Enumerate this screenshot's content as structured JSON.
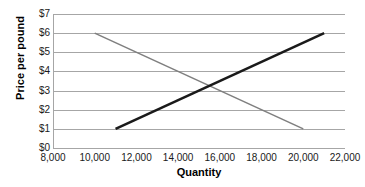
{
  "chart_data": {
    "type": "line",
    "title": "",
    "xlabel": "Quantity",
    "ylabel": "Price per pound",
    "xlim": [
      8000,
      22000
    ],
    "ylim": [
      0,
      7
    ],
    "xticks": [
      "8,000",
      "10,000",
      "12,000",
      "14,000",
      "16,000",
      "18,000",
      "20,000",
      "22,000"
    ],
    "xtick_values": [
      8000,
      10000,
      12000,
      14000,
      16000,
      18000,
      20000,
      22000
    ],
    "yticks": [
      "$0",
      "$1",
      "$2",
      "$3",
      "$4",
      "$5",
      "$6",
      "$7"
    ],
    "ytick_values": [
      0,
      1,
      2,
      3,
      4,
      5,
      6,
      7
    ],
    "grid": true,
    "legend": "none",
    "series": [
      {
        "name": "demand",
        "color": "#7f7f7f",
        "width": 1.6,
        "points": [
          {
            "x": 10000,
            "y": 6
          },
          {
            "x": 20000,
            "y": 1
          }
        ]
      },
      {
        "name": "supply",
        "color": "#1a1a1a",
        "width": 2.6,
        "points": [
          {
            "x": 11000,
            "y": 1
          },
          {
            "x": 21000,
            "y": 6
          }
        ]
      }
    ],
    "intersection": {
      "x": 15500,
      "y": 3.25
    }
  },
  "colors": {
    "grid": "#a6a6a6",
    "background": "#ffffff",
    "text": "#1a1a1a"
  }
}
